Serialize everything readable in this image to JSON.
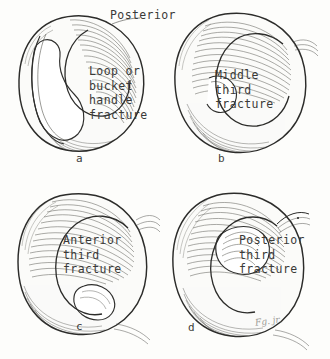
{
  "plate": {
    "title": "Types of meniscus fracture",
    "background_color": "#fdfdfb",
    "ink_color": "#3a3a38",
    "heading": "Posterior",
    "signature": "Fg. jr."
  },
  "panels": [
    {
      "letter": "a",
      "name": "loop-or-bucket-handle-fracture",
      "caption_lines": [
        "Loop or",
        "bucket",
        "handle",
        "fracture"
      ],
      "caption_text": "Loop or bucket handle fracture"
    },
    {
      "letter": "b",
      "name": "middle-third-fracture",
      "caption_lines": [
        "Middle",
        "third",
        "fracture"
      ],
      "caption_text": "Middle third fracture"
    },
    {
      "letter": "c",
      "name": "anterior-third-fracture",
      "caption_lines": [
        "Anterior",
        "third",
        "fracture"
      ],
      "caption_text": "Anterior third fracture"
    },
    {
      "letter": "d",
      "name": "posterior-third-fracture",
      "caption_lines": [
        "Posterior",
        "third",
        "fracture"
      ],
      "caption_text": "Posterior third fracture"
    }
  ]
}
